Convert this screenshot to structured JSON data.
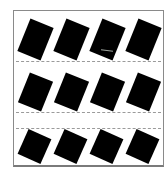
{
  "scene": {
    "description": "Grid of twelve tilted black rectangles inside a thin gray frame, with dashed separator lines between rows",
    "background_color": "#ffffff",
    "frame_color": "#8a8a8a",
    "tile_color": "#000000",
    "dash_color": "#9a9a9a",
    "grid": {
      "columns": 4,
      "rows": 3
    },
    "rows": [
      {
        "tiles": [
          {
            "cx": 35,
            "cy": 39,
            "w": 25,
            "h": 35,
            "angle": 22
          },
          {
            "cx": 71,
            "cy": 39,
            "w": 25,
            "h": 35,
            "angle": 22
          },
          {
            "cx": 107,
            "cy": 39,
            "w": 25,
            "h": 35,
            "angle": 22
          },
          {
            "cx": 143,
            "cy": 39,
            "w": 25,
            "h": 35,
            "angle": 22
          }
        ]
      },
      {
        "tiles": [
          {
            "cx": 35,
            "cy": 92,
            "w": 25,
            "h": 32,
            "angle": 22
          },
          {
            "cx": 71,
            "cy": 92,
            "w": 25,
            "h": 32,
            "angle": 22
          },
          {
            "cx": 107,
            "cy": 92,
            "w": 25,
            "h": 32,
            "angle": 22
          },
          {
            "cx": 143,
            "cy": 92,
            "w": 25,
            "h": 32,
            "angle": 22
          }
        ]
      },
      {
        "tiles": [
          {
            "cx": 34,
            "cy": 146,
            "w": 25,
            "h": 27,
            "angle": 24
          },
          {
            "cx": 70,
            "cy": 146,
            "w": 25,
            "h": 27,
            "angle": 24
          },
          {
            "cx": 106,
            "cy": 146,
            "w": 25,
            "h": 27,
            "angle": 24
          },
          {
            "cx": 142,
            "cy": 146,
            "w": 25,
            "h": 27,
            "angle": 24
          }
        ]
      }
    ],
    "dashed_lines_y": [
      61,
      112,
      128
    ],
    "scratch": {
      "x": 101,
      "y": 50
    }
  }
}
